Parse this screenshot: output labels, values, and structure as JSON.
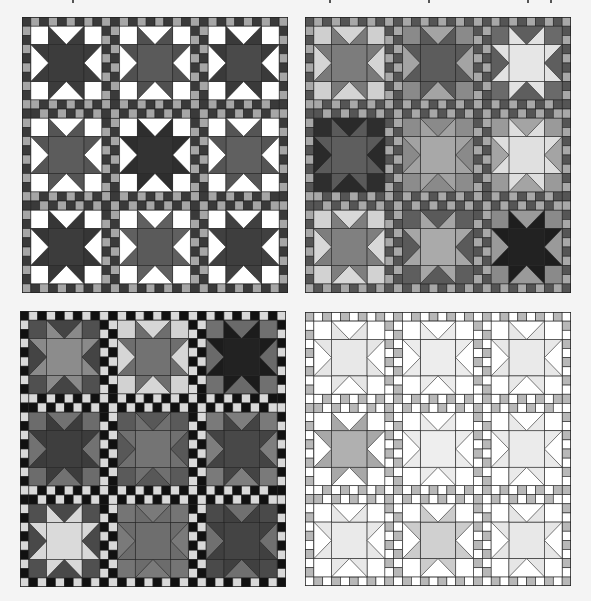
{
  "page": {
    "background": "#f4f4f4",
    "top_text_fragments": [
      72,
      329,
      428,
      527,
      550
    ]
  },
  "quilts": [
    {
      "id": "quilt-1",
      "position": {
        "x": 22,
        "y": 17
      },
      "sashing": {
        "dark": "#3a3a3a",
        "light": "#a6a6a6"
      },
      "blocks": [
        {
          "corner": "#ffffff",
          "goose": "#ffffff",
          "point": "#3c3c3c",
          "center": "#3c3c3c"
        },
        {
          "corner": "#ffffff",
          "goose": "#ffffff",
          "point": "#505050",
          "center": "#5a5a5a"
        },
        {
          "corner": "#ffffff",
          "goose": "#ffffff",
          "point": "#3a3a3a",
          "center": "#4a4a4a"
        },
        {
          "corner": "#ffffff",
          "goose": "#ffffff",
          "point": "#555555",
          "center": "#5c5c5c"
        },
        {
          "corner": "#ffffff",
          "goose": "#ffffff",
          "point": "#2e2e2e",
          "center": "#333333"
        },
        {
          "corner": "#ffffff",
          "goose": "#ffffff",
          "point": "#555555",
          "center": "#606060"
        },
        {
          "corner": "#ffffff",
          "goose": "#ffffff",
          "point": "#363636",
          "center": "#3c3c3c"
        },
        {
          "corner": "#ffffff",
          "goose": "#ffffff",
          "point": "#606060",
          "center": "#5a5a5a"
        },
        {
          "corner": "#ffffff",
          "goose": "#ffffff",
          "point": "#404040",
          "center": "#3e3e3e"
        }
      ]
    },
    {
      "id": "quilt-2",
      "position": {
        "x": 305,
        "y": 17
      },
      "sashing": {
        "dark": "#555555",
        "light": "#a8a8a8"
      },
      "blocks": [
        {
          "corner": "#cfcfcf",
          "goose": "#d4d4d4",
          "point": "#7a7a7a",
          "center": "#7c7c7c"
        },
        {
          "corner": "#8a8a8a",
          "goose": "#a4a4a4",
          "point": "#5a5a5a",
          "center": "#5c5c5c"
        },
        {
          "corner": "#6a6a6a",
          "goose": "#5e5e5e",
          "point": "#e2e2e2",
          "center": "#e6e6e6"
        },
        {
          "corner": "#2e2e2e",
          "goose": "#2a2a2a",
          "point": "#5a5a5a",
          "center": "#5e5e5e"
        },
        {
          "corner": "#8c8c8c",
          "goose": "#8a8a8a",
          "point": "#a2a2a2",
          "center": "#a8a8a8"
        },
        {
          "corner": "#9a9a9a",
          "goose": "#a4a4a4",
          "point": "#dedede",
          "center": "#e0e0e0"
        },
        {
          "corner": "#d2d2d2",
          "goose": "#d8d8d8",
          "point": "#7e7e7e",
          "center": "#808080"
        },
        {
          "corner": "#5e5e5e",
          "goose": "#5a5a5a",
          "point": "#a6a6a6",
          "center": "#aaaaaa"
        },
        {
          "corner": "#8a8a8a",
          "goose": "#9a9a9a",
          "point": "#1e1e1e",
          "center": "#222222"
        }
      ]
    },
    {
      "id": "quilt-3",
      "position": {
        "x": 20,
        "y": 311
      },
      "sashing": {
        "dark": "#111111",
        "light": "#d9d9d9"
      },
      "blocks": [
        {
          "corner": "#505050",
          "goose": "#444444",
          "point": "#8a8a8a",
          "center": "#8c8c8c"
        },
        {
          "corner": "#d2d2d2",
          "goose": "#d6d6d6",
          "point": "#6e6e6e",
          "center": "#727272"
        },
        {
          "corner": "#707070",
          "goose": "#6a6a6a",
          "point": "#1c1c1c",
          "center": "#222222"
        },
        {
          "corner": "#6c6c6c",
          "goose": "#727272",
          "point": "#3c3c3c",
          "center": "#3e3e3e"
        },
        {
          "corner": "#5a5a5a",
          "goose": "#585858",
          "point": "#707070",
          "center": "#747474"
        },
        {
          "corner": "#7a7a7a",
          "goose": "#7e7e7e",
          "point": "#444444",
          "center": "#484848"
        },
        {
          "corner": "#505050",
          "goose": "#494949",
          "point": "#d8d8d8",
          "center": "#dadada"
        },
        {
          "corner": "#757575",
          "goose": "#7a7a7a",
          "point": "#6c6c6c",
          "center": "#6e6e6e"
        },
        {
          "corner": "#4a4a4a",
          "goose": "#707070",
          "point": "#404040",
          "center": "#444444"
        }
      ]
    },
    {
      "id": "quilt-4",
      "position": {
        "x": 305,
        "y": 312
      },
      "sashing": {
        "dark": "#b8b8b8",
        "light": "#ffffff"
      },
      "blocks": [
        {
          "corner": "#ffffff",
          "goose": "#ffffff",
          "point": "#e6e6e6",
          "center": "#e8e8e8"
        },
        {
          "corner": "#ffffff",
          "goose": "#ffffff",
          "point": "#ececec",
          "center": "#ededed"
        },
        {
          "corner": "#ffffff",
          "goose": "#ffffff",
          "point": "#e8e8e8",
          "center": "#eaeaea"
        },
        {
          "corner": "#ffffff",
          "goose": "#ffffff",
          "point": "#a8a8a8",
          "center": "#b0b0b0"
        },
        {
          "corner": "#ffffff",
          "goose": "#ffffff",
          "point": "#ececec",
          "center": "#eeeeee"
        },
        {
          "corner": "#ffffff",
          "goose": "#ffffff",
          "point": "#eaeaea",
          "center": "#ebebeb"
        },
        {
          "corner": "#ffffff",
          "goose": "#ffffff",
          "point": "#e8e8e8",
          "center": "#eaeaea"
        },
        {
          "corner": "#ffffff",
          "goose": "#ffffff",
          "point": "#cccccc",
          "center": "#d0d0d0"
        },
        {
          "corner": "#ffffff",
          "goose": "#ffffff",
          "point": "#e6e6e6",
          "center": "#e8e8e8"
        }
      ]
    }
  ],
  "geometry": {
    "border_square": 9,
    "block_size": 72,
    "sash_width": 18,
    "rows": 3,
    "cols": 3
  }
}
